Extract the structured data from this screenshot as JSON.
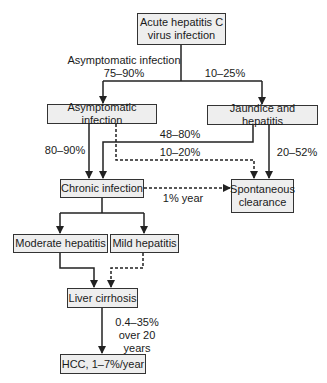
{
  "diagram": {
    "type": "flowchart",
    "colors": {
      "box_fill": "#eeeeee",
      "box_border": "#333333",
      "line": "#222222"
    },
    "nodes": {
      "acute": "Acute hepatitis C\nvirus infection",
      "asymptomatic": "Asymptomatic infection",
      "jaundice": "Jaundice and hepatitis",
      "chronic": "Chronic infection",
      "spontaneous": "Spontaneous\nclearance",
      "moderate": "Moderate hepatitis",
      "mild": "Mild hepatitis",
      "cirrhosis": "Liver cirrhosis",
      "hcc": "HCC, 1–7%/year"
    },
    "edge_labels": {
      "acute_to_asymptomatic": "Asymptomatic infection\n75–90%",
      "acute_to_jaundice": "10–25%",
      "asymptomatic_to_chronic": "80–90%",
      "jaundice_to_chronic": "48–80%",
      "asymptomatic_to_clearance": "10–20%",
      "jaundice_to_clearance": "20–52%",
      "chronic_to_clearance": "1% year",
      "cirrhosis_to_hcc": "0.4–35%\nover 20 years"
    },
    "edges": [
      {
        "from": "acute",
        "to": "asymptomatic",
        "style": "solid"
      },
      {
        "from": "acute",
        "to": "jaundice",
        "style": "solid"
      },
      {
        "from": "asymptomatic",
        "to": "chronic",
        "style": "solid"
      },
      {
        "from": "asymptomatic",
        "to": "spontaneous",
        "style": "dashed"
      },
      {
        "from": "jaundice",
        "to": "chronic",
        "style": "solid"
      },
      {
        "from": "jaundice",
        "to": "spontaneous",
        "style": "solid"
      },
      {
        "from": "chronic",
        "to": "spontaneous",
        "style": "dashed"
      },
      {
        "from": "chronic",
        "to": "moderate",
        "style": "solid"
      },
      {
        "from": "chronic",
        "to": "mild",
        "style": "solid"
      },
      {
        "from": "moderate",
        "to": "cirrhosis",
        "style": "solid"
      },
      {
        "from": "mild",
        "to": "cirrhosis",
        "style": "dashed"
      },
      {
        "from": "cirrhosis",
        "to": "hcc",
        "style": "solid"
      }
    ]
  }
}
